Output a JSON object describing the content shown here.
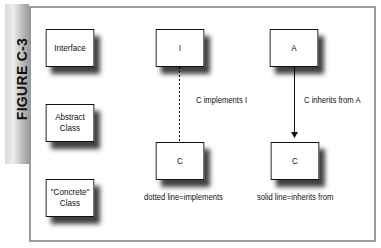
{
  "figure": {
    "label": "FIGURE C-3"
  },
  "legend": {
    "items": [
      {
        "label": "Interface"
      },
      {
        "label": "Abstract Class"
      },
      {
        "label": "\"Concrete\" Class"
      }
    ]
  },
  "implements_example": {
    "top_box": "I",
    "bottom_box": "C",
    "relation_label": "C implements I",
    "caption": "dotted line=implements",
    "line_style": "dotted"
  },
  "inherits_example": {
    "top_box": "A",
    "bottom_box": "C",
    "relation_label": "C inherits from A",
    "caption": "solid line=inherits from",
    "line_style": "solid-arrow"
  },
  "colors": {
    "frame": "#9a9a9a",
    "tab": "#bdbdbd",
    "ink": "#111111"
  }
}
